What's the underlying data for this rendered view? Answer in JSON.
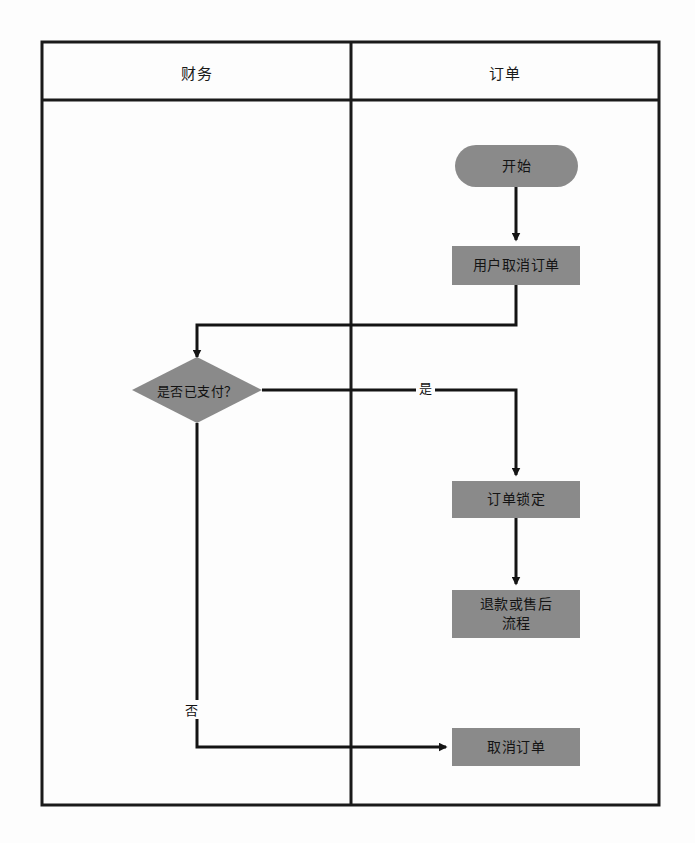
{
  "diagram": {
    "type": "swimlane-flowchart",
    "lanes": [
      {
        "id": "finance",
        "title": "财务"
      },
      {
        "id": "order",
        "title": "订单"
      }
    ],
    "nodes": [
      {
        "id": "start",
        "label": "开始",
        "shape": "rounded",
        "lane": "order"
      },
      {
        "id": "cancel_req",
        "label": "用户取消订单",
        "shape": "rect",
        "lane": "order"
      },
      {
        "id": "paid",
        "label": "是否已支付？",
        "shape": "diamond",
        "lane": "finance"
      },
      {
        "id": "lock",
        "label": "订单锁定",
        "shape": "rect",
        "lane": "order"
      },
      {
        "id": "refund",
        "label_line1": "退款或售后",
        "label_line2": "流程",
        "shape": "rect",
        "lane": "order"
      },
      {
        "id": "cancel",
        "label": "取消订单",
        "shape": "rect",
        "lane": "order"
      }
    ],
    "edges": [
      {
        "from": "start",
        "to": "cancel_req",
        "label": ""
      },
      {
        "from": "cancel_req",
        "to": "paid",
        "label": ""
      },
      {
        "from": "paid",
        "to": "lock",
        "label": "是"
      },
      {
        "from": "paid",
        "to": "cancel",
        "label": "否"
      },
      {
        "from": "lock",
        "to": "refund",
        "label": ""
      }
    ],
    "colors": {
      "node_fill": "#8a8a8a",
      "border": "#1a1a1a",
      "connector": "#141414",
      "background": "#fdfdfd",
      "text": "#141414"
    }
  }
}
